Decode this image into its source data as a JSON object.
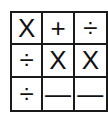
{
  "grid": {
    "rows": [
      [
        "X",
        "+",
        "÷"
      ],
      [
        "÷",
        "X",
        "X"
      ],
      [
        "÷",
        "—",
        "—"
      ]
    ]
  }
}
